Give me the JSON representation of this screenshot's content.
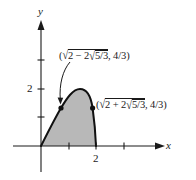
{
  "figure": {
    "axes": {
      "x_label": "x",
      "y_label": "y",
      "x_tick_labels": {
        "two": "2"
      },
      "y_tick_labels": {
        "two": "2"
      },
      "x_ticks": [
        1,
        2,
        3
      ],
      "y_ticks": [
        1,
        2,
        3
      ]
    },
    "annotations": {
      "left_point": {
        "open": "(",
        "sqrt_lead": "2 − 2",
        "inner_sqrt": "5/3",
        "tail": ", 4/3)",
        "full_text": "(√(2 − 2√5/3), 4/3)"
      },
      "right_point": {
        "open": "(",
        "sqrt_lead": "2 + 2",
        "inner_sqrt": "5/3",
        "tail": ", 4/3)",
        "full_text": "(√(2 + 2√5/3), 4/3)"
      }
    },
    "curve": {
      "note": "Curve equation not shown in image; path is a smooth interpolation through the points read off the figure.",
      "observed_points": [
        {
          "x": 0,
          "y": 0,
          "source": "origin"
        },
        {
          "x": 0.715,
          "y": 1.333,
          "source": "labeled point sqrt(2-2sqrt(5)/3), 4/3"
        },
        {
          "x": 1.4,
          "y": 2.0,
          "source": "peak, estimated from gridline y=2"
        },
        {
          "x": 1.87,
          "y": 1.333,
          "source": "labeled point sqrt(2+2sqrt(5)/3), 4/3"
        },
        {
          "x": 2,
          "y": 0,
          "source": "x-intercept at tick 2"
        }
      ],
      "shaded_region": "between curve and x-axis for 0 <= x <= 2"
    },
    "colors": {
      "fill": "#b8b8b8",
      "stroke": "#111111",
      "background": "#ffffff"
    }
  }
}
